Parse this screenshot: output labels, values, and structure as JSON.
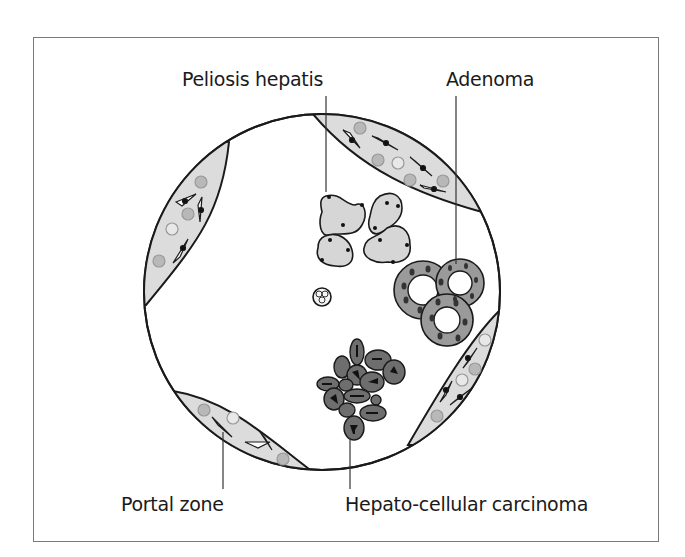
{
  "figure": {
    "type": "histology-schematic",
    "colors": {
      "frame": "#7a7a7a",
      "outline": "#1a1a1a",
      "portal_fill": "#dcdcdc",
      "peliosis_fill": "#d6d6d6",
      "adenoma_fill": "#9a9a9a",
      "carcinoma_fill": "#6e6e6e",
      "nucleus": "#111111",
      "blood_cell": "#b8b8b8"
    }
  },
  "labels": {
    "peliosis": "Peliosis hepatis",
    "adenoma": "Adenoma",
    "portal_zone": "Portal zone",
    "carcinoma": "Hepato-cellular carcinoma"
  }
}
